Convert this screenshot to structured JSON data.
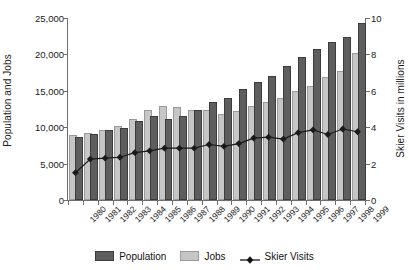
{
  "chart_data": {
    "type": "bar",
    "title": "",
    "xlabel": "",
    "ylabel": "Population and Jobs",
    "ylabel_secondary": "Skier Visits in millions",
    "categories": [
      "1980",
      "1981",
      "1982",
      "1983",
      "1984",
      "1985",
      "1986",
      "1987",
      "1988",
      "1989",
      "1990",
      "1991",
      "1992",
      "1993",
      "1994",
      "1995",
      "1996",
      "1997",
      "1998",
      "1999"
    ],
    "ylim": [
      0,
      25000
    ],
    "ylim_secondary": [
      0,
      10
    ],
    "yticks": [
      "0",
      "5,000",
      "10,000",
      "15,000",
      "20,000",
      "25,000"
    ],
    "ytick_values": [
      0,
      5000,
      10000,
      15000,
      20000,
      25000
    ],
    "yticks_secondary": [
      "0",
      "2",
      "4",
      "6",
      "8",
      "10"
    ],
    "ytick_values_secondary": [
      0,
      2,
      4,
      6,
      8,
      10
    ],
    "grid": false,
    "legend_position": "bottom",
    "series": [
      {
        "name": "Jobs",
        "axis": "left",
        "type": "bar",
        "color": "#c6c6c6",
        "values": [
          8700,
          8950,
          9350,
          9900,
          10800,
          12050,
          12700,
          12500,
          12150,
          12150,
          11600,
          12000,
          12600,
          13150,
          13700,
          14650,
          15400,
          16600,
          17400,
          19950
        ]
      },
      {
        "name": "Population",
        "axis": "left",
        "type": "bar",
        "color": "#5e5e5e",
        "values": [
          8350,
          8800,
          9300,
          9600,
          10600,
          11200,
          10800,
          11250,
          12150,
          13200,
          13750,
          15000,
          15900,
          16800,
          18200,
          19400,
          20500,
          21400,
          22100,
          24000
        ]
      },
      {
        "name": "Skier Visits",
        "axis": "right",
        "type": "line",
        "color": "#1a1a1a",
        "marker": "diamond",
        "values": [
          1.5,
          2.25,
          2.3,
          2.35,
          2.6,
          2.7,
          2.85,
          2.85,
          2.85,
          3.05,
          2.95,
          3.1,
          3.4,
          3.45,
          3.35,
          3.7,
          3.85,
          3.6,
          3.9,
          3.75
        ]
      }
    ]
  },
  "legend": {
    "items": [
      {
        "label": "Population",
        "swatch": "population-swatch"
      },
      {
        "label": "Jobs",
        "swatch": "jobs-swatch"
      },
      {
        "label": "Skier Visits",
        "swatch": "skier-visits-marker"
      }
    ]
  }
}
